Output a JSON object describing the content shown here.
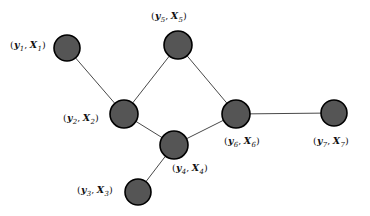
{
  "figure": {
    "type": "undirected-graph",
    "background_color": "#ffffff",
    "node_fill_color": "#555555",
    "node_stroke_color": "#000000",
    "edge_color": "#333333",
    "node_radius": 13.5,
    "node_stroke_width": 1.6,
    "edge_width": 0.9
  },
  "nodes": [
    {
      "id": "1",
      "cx": 67,
      "cy": 48,
      "r": 13,
      "label_text": "(y₁, X₁)",
      "label_y": "y",
      "label_x": "X",
      "label_sub": "1",
      "label_left": 10,
      "label_top": 40,
      "label_align": "left"
    },
    {
      "id": "2",
      "cx": 124,
      "cy": 114,
      "r": 14,
      "label_text": "(y₂, X₂)",
      "label_y": "y",
      "label_x": "X",
      "label_sub": "2",
      "label_left": 63,
      "label_top": 113,
      "label_align": "left"
    },
    {
      "id": "3",
      "cx": 138,
      "cy": 192,
      "r": 13,
      "label_text": "(y₃, X₃)",
      "label_y": "y",
      "label_x": "X",
      "label_sub": "3",
      "label_left": 77,
      "label_top": 185,
      "label_align": "left"
    },
    {
      "id": "4",
      "cx": 174,
      "cy": 145,
      "r": 14,
      "label_text": "(y₄, X₄)",
      "label_y": "y",
      "label_x": "X",
      "label_sub": "4",
      "label_left": 172,
      "label_top": 163,
      "label_align": "left"
    },
    {
      "id": "5",
      "cx": 178,
      "cy": 45,
      "r": 14,
      "label_text": "(y₅, X₅)",
      "label_y": "y",
      "label_x": "X",
      "label_sub": "5",
      "label_left": 151,
      "label_top": 11,
      "label_align": "left"
    },
    {
      "id": "6",
      "cx": 236,
      "cy": 114,
      "r": 14,
      "label_text": "(y₆, X₆)",
      "label_y": "y",
      "label_x": "X",
      "label_sub": "6",
      "label_left": 224,
      "label_top": 136,
      "label_align": "left"
    },
    {
      "id": "7",
      "cx": 334,
      "cy": 113,
      "r": 13,
      "label_text": "(y₇, X₇)",
      "label_y": "y",
      "label_x": "X",
      "label_sub": "7",
      "label_left": 313,
      "label_top": 136,
      "label_align": "left"
    }
  ],
  "edges": [
    {
      "from": "1",
      "to": "2"
    },
    {
      "from": "2",
      "to": "5"
    },
    {
      "from": "2",
      "to": "4"
    },
    {
      "from": "3",
      "to": "4"
    },
    {
      "from": "4",
      "to": "6"
    },
    {
      "from": "5",
      "to": "6"
    },
    {
      "from": "6",
      "to": "7"
    }
  ]
}
